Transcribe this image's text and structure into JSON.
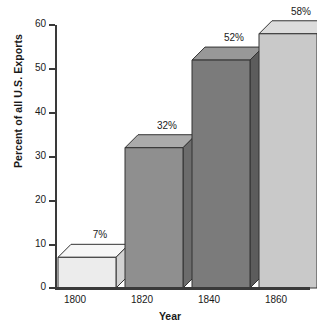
{
  "chart_data": {
    "type": "bar",
    "title": "",
    "subtitle": "",
    "xlabel": "Year",
    "ylabel": "Percent of all U.S. Exports",
    "categories": [
      "1800",
      "1820",
      "1840",
      "1860"
    ],
    "values": [
      7,
      32,
      52,
      58
    ],
    "data_labels": [
      "7%",
      "32%",
      "52%",
      "58%"
    ],
    "ylim": [
      0,
      60
    ],
    "yticks": [
      0,
      10,
      20,
      30,
      40,
      50,
      60
    ],
    "ytick_labels": [
      "0",
      "10",
      "20",
      "30",
      "40",
      "50",
      "60"
    ],
    "grid": false,
    "legend": false,
    "legend_position": "none",
    "style": "3d-bar",
    "series": [
      {
        "name": "Percent of all U.S. Exports",
        "values": [
          7,
          32,
          52,
          58
        ]
      }
    ],
    "bar_colors": [
      "#ececec",
      "#8f8f8f",
      "#7b7b7b",
      "#c9c9c9"
    ],
    "bar_side_colors": [
      "#d2d2d2",
      "#6c6c6c",
      "#5c5c5c",
      "#9e9e9e"
    ],
    "bar_top_colors": [
      "#f7f7f7",
      "#ababab",
      "#989898",
      "#dcdcdc"
    ],
    "axis_color": "#3a3a3a",
    "text_color": "#1a1a1a",
    "background": "#ffffff"
  },
  "axis": {
    "y_title": "Percent of all U.S. Exports",
    "x_title": "Year"
  }
}
